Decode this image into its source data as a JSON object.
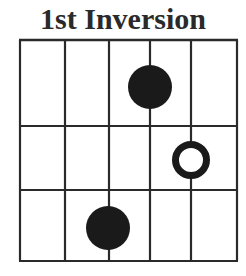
{
  "title": "1st Inversion",
  "colors": {
    "line": "#2a2a2a",
    "dot": "#1a1a1a",
    "background": "#ffffff"
  },
  "grid": {
    "strings_x": [
      20,
      65,
      109,
      150,
      191,
      237
    ],
    "frets_y": [
      40,
      126,
      190,
      261
    ],
    "string_count": 6,
    "fret_rows": 3
  },
  "markers": [
    {
      "type": "filled",
      "string": 4,
      "fret": 1,
      "cx": 150,
      "cy": 87,
      "r": 22
    },
    {
      "type": "open-ring",
      "string": 5,
      "fret": 2,
      "cx": 191,
      "cy": 160,
      "r": 19
    },
    {
      "type": "filled",
      "string": 3,
      "fret": 3,
      "cx": 108,
      "cy": 228,
      "r": 22
    }
  ]
}
